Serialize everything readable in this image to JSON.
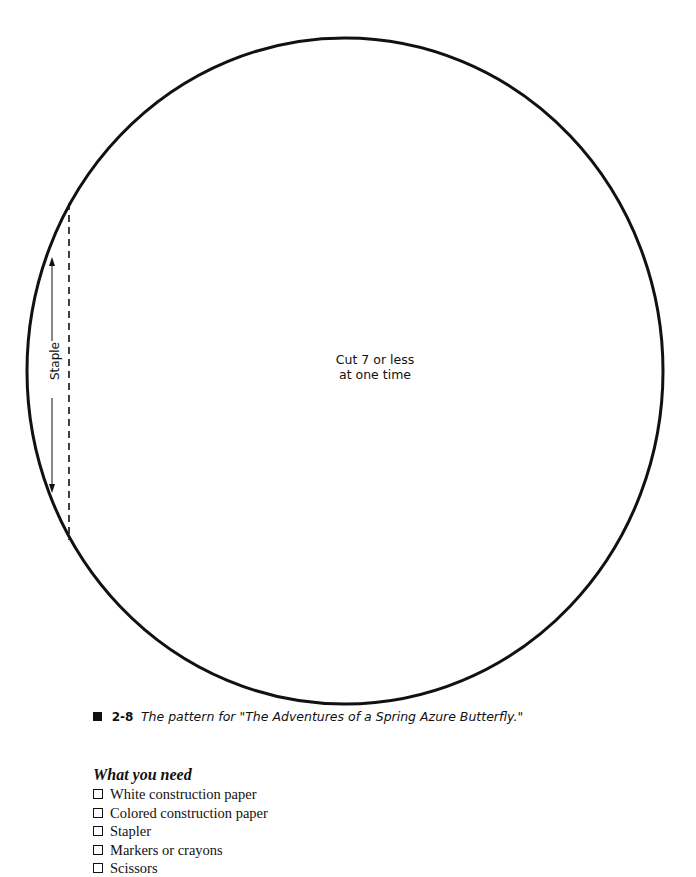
{
  "pattern": {
    "shape": "circle",
    "center_note_line1": "Cut 7 or less",
    "center_note_line2": "at one time",
    "staple_label": "Staple",
    "stroke_color": "#111111"
  },
  "caption": {
    "marker": "square-bullet",
    "figure_number": "2-8",
    "text": "The pattern for \"The Adventures of a  Spring Azure Butterfly.\""
  },
  "needs": {
    "heading": "What you need",
    "items": [
      {
        "label": "White construction paper",
        "checked": false
      },
      {
        "label": "Colored construction paper",
        "checked": false
      },
      {
        "label": "Stapler",
        "checked": false
      },
      {
        "label": "Markers or crayons",
        "checked": false
      },
      {
        "label": "Scissors",
        "checked": false
      }
    ]
  }
}
